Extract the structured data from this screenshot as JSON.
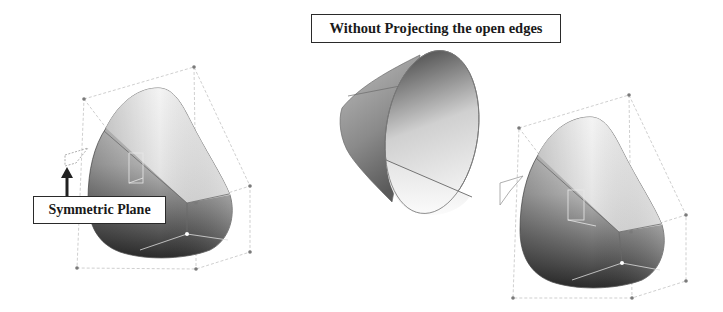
{
  "labels": {
    "title": "Without Projecting the open edges",
    "symmetric_plane": "Symmetric Plane"
  },
  "figures": [
    {
      "id": "left-surface",
      "description": "Closed blended surface with control-point bounding box and symmetric plane marker"
    },
    {
      "id": "middle-surface",
      "description": "Open cone-like surface without projecting the open edges"
    },
    {
      "id": "right-surface",
      "description": "Closed blended surface with control-point bounding box"
    }
  ],
  "colors": {
    "background": "#ffffff",
    "label_border": "#2a2a2a",
    "label_text": "#1a1a1a",
    "control_lines": "#c8c8c8",
    "control_points": "#7a7a7a",
    "arrow": "#222222"
  }
}
